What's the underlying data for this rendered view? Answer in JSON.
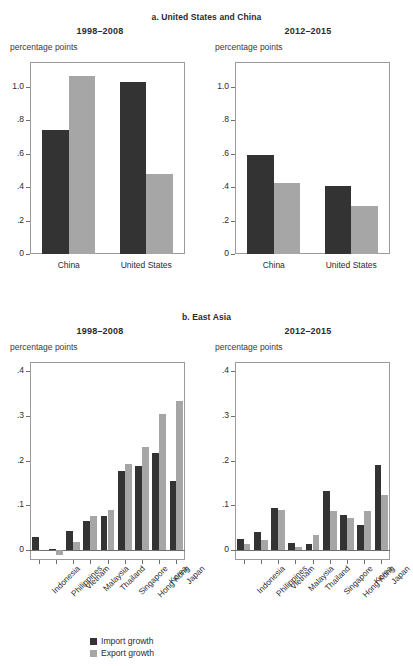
{
  "figure": {
    "panel_a_title": "a. United States and China",
    "panel_b_title": "b. East Asia",
    "axis_unit": "percentage points",
    "period_1": "1998–2008",
    "period_2": "2012–2015"
  },
  "legend": {
    "items": [
      {
        "label": "Import growth",
        "color": "#333333"
      },
      {
        "label": "Export growth",
        "color": "#a6a6a6"
      }
    ]
  },
  "colors": {
    "import": "#333333",
    "export": "#a6a6a6",
    "axis": "#9b9b9b",
    "text": "#2b2b2b"
  },
  "chart_data": [
    {
      "type": "bar",
      "title": "1998–2008",
      "panel": "a. United States and China",
      "categories": [
        "China",
        "United States"
      ],
      "series": [
        {
          "name": "Import growth",
          "values": [
            0.745,
            1.03
          ]
        },
        {
          "name": "Export growth",
          "values": [
            1.065,
            0.48
          ]
        }
      ],
      "ylabel": "percentage points",
      "xlabel": "",
      "ylim": [
        0,
        1.15
      ],
      "yticks": [
        0,
        0.2,
        0.4,
        0.6,
        0.8,
        1.0
      ],
      "ytick_labels": [
        "0",
        ".2",
        ".4",
        ".6",
        ".8",
        "1.0"
      ],
      "grid": false,
      "legend_position": "bottom"
    },
    {
      "type": "bar",
      "title": "2012–2015",
      "panel": "a. United States and China",
      "categories": [
        "China",
        "United States"
      ],
      "series": [
        {
          "name": "Import growth",
          "values": [
            0.59,
            0.41
          ]
        },
        {
          "name": "Export growth",
          "values": [
            0.425,
            0.285
          ]
        }
      ],
      "ylabel": "percentage points",
      "xlabel": "",
      "ylim": [
        0,
        1.15
      ],
      "yticks": [
        0,
        0.2,
        0.4,
        0.6,
        0.8,
        1.0
      ],
      "ytick_labels": [
        "0",
        ".2",
        ".4",
        ".6",
        ".8",
        "1.0"
      ],
      "grid": false,
      "legend_position": "bottom"
    },
    {
      "type": "bar",
      "title": "1998–2008",
      "panel": "b. East Asia",
      "categories": [
        "Indonesia",
        "Philippines",
        "Vietnam",
        "Malaysia",
        "Thailand",
        "Singapore",
        "Hong Kong",
        "Korea",
        "Japan"
      ],
      "series": [
        {
          "name": "Import growth",
          "values": [
            0.03,
            0.002,
            0.043,
            0.065,
            0.077,
            0.176,
            0.188,
            0.216,
            0.154
          ]
        },
        {
          "name": "Export growth",
          "values": [
            0.0,
            -0.01,
            0.018,
            0.077,
            0.089,
            0.193,
            0.231,
            0.305,
            0.332
          ]
        }
      ],
      "ylabel": "percentage points",
      "xlabel": "",
      "ylim": [
        -0.022,
        0.42
      ],
      "yticks": [
        0,
        0.1,
        0.2,
        0.3,
        0.4
      ],
      "ytick_labels": [
        "0",
        ".1",
        ".2",
        ".3",
        ".4"
      ],
      "grid": false,
      "legend_position": "bottom"
    },
    {
      "type": "bar",
      "title": "2012–2015",
      "panel": "b. East Asia",
      "categories": [
        "Indonesia",
        "Philippines",
        "Vietnam",
        "Malaysia",
        "Thailand",
        "Singapore",
        "Hong Kong",
        "Korea",
        "Japan"
      ],
      "series": [
        {
          "name": "Import growth",
          "values": [
            0.024,
            0.041,
            0.095,
            0.015,
            0.013,
            0.131,
            0.079,
            0.057,
            0.19
          ]
        },
        {
          "name": "Export growth",
          "values": [
            0.013,
            0.022,
            0.09,
            0.006,
            0.034,
            0.088,
            0.072,
            0.087,
            0.123
          ]
        }
      ],
      "ylabel": "percentage points",
      "xlabel": "",
      "ylim": [
        -0.022,
        0.42
      ],
      "yticks": [
        0,
        0.1,
        0.2,
        0.3,
        0.4
      ],
      "ytick_labels": [
        "0",
        ".1",
        ".2",
        ".3",
        ".4"
      ],
      "grid": false,
      "legend_position": "bottom"
    }
  ]
}
